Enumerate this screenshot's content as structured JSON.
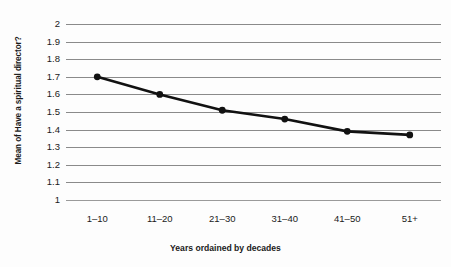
{
  "chart_data": {
    "type": "line",
    "title": "",
    "subtitle": "",
    "xlabel": "Years ordained by decades",
    "ylabel": "Mean of Have a spiritual director?",
    "categories": [
      "1–10",
      "11–20",
      "21–30",
      "31–40",
      "41–50",
      "51+"
    ],
    "values": [
      1.7,
      1.6,
      1.51,
      1.46,
      1.39,
      1.37
    ],
    "series": [
      {
        "name": "Mean of Have a spiritual director?",
        "values": [
          1.7,
          1.6,
          1.51,
          1.46,
          1.39,
          1.37
        ]
      }
    ],
    "ylim": [
      1,
      2
    ],
    "ytick_step": 0.1,
    "yticks": [
      "2",
      "1.9",
      "1.8",
      "1.7",
      "1.6",
      "1.5",
      "1.4",
      "1.3",
      "1.2",
      "1.1",
      "1"
    ],
    "ytick_values": [
      2,
      1.9,
      1.8,
      1.7,
      1.6,
      1.5,
      1.4,
      1.3,
      1.2,
      1.1,
      1
    ],
    "grid": true,
    "grid_orientation": "horizontal",
    "legend": false,
    "legend_position": "none",
    "marker": "circle",
    "line_color": "#111111",
    "marker_color": "#111111",
    "grid_color": "#8a8a8a",
    "background_color": "#fdfdfd"
  }
}
